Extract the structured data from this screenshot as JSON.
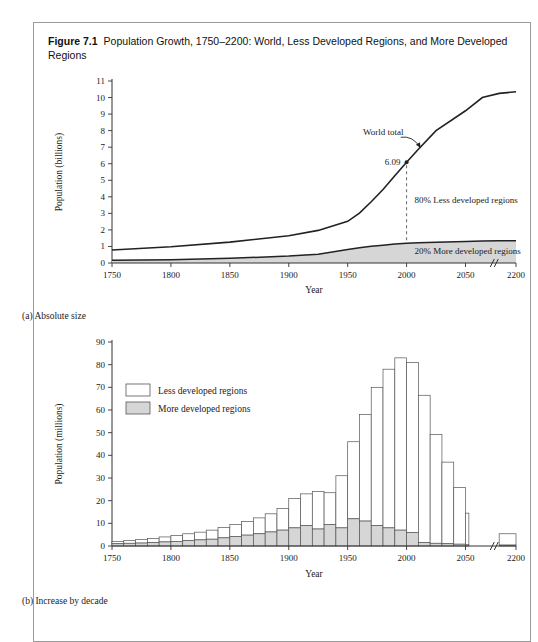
{
  "figure": {
    "number": "Figure 7.1",
    "title": "Population Growth, 1750–2200: World, Less Developed Regions, and More Developed Regions",
    "caption_a": "(a) Absolute size",
    "caption_b": "(b) Increase by decade"
  },
  "colors": {
    "line": "#222222",
    "more_developed_fill": "#d6d6d6",
    "less_developed_fill": "#ffffff",
    "bar_stroke": "#555555",
    "axis": "#333333",
    "border": "#9a9a9a"
  },
  "chart_data": [
    {
      "id": "panel-a",
      "type": "area",
      "title": "(a) Absolute size",
      "xlabel": "Year",
      "ylabel": "Population (billions)",
      "xlim": [
        1750,
        2200
      ],
      "ylim": [
        0,
        11
      ],
      "axis_break": {
        "label": "//",
        "after_tick": 2050
      },
      "xticks": [
        1750,
        1800,
        1850,
        1900,
        1950,
        2000,
        2050,
        2200
      ],
      "yticks": [
        0,
        1,
        2,
        3,
        4,
        5,
        6,
        7,
        8,
        9,
        10,
        11
      ],
      "grid": false,
      "annotations": [
        {
          "name": "world-total",
          "text": "World total",
          "x": 1995,
          "y": 7.6
        },
        {
          "name": "point-value",
          "text": "6.09",
          "x": 2000,
          "y": 6.09
        },
        {
          "name": "less-developed-share",
          "text": "80% Less developed regions",
          "x": 2010,
          "y": 3.6
        },
        {
          "name": "more-developed-share",
          "text": "20% More developed regions",
          "x": 2010,
          "y": 0.75
        }
      ],
      "x": [
        1750,
        1800,
        1850,
        1900,
        1925,
        1950,
        1960,
        1970,
        1980,
        1990,
        2000,
        2010,
        2025,
        2050,
        2100,
        2150,
        2200
      ],
      "series": [
        {
          "name": "World total",
          "values": [
            0.79,
            0.98,
            1.26,
            1.65,
            1.97,
            2.52,
            3.02,
            3.7,
            4.44,
            5.27,
            6.09,
            6.87,
            8.0,
            9.2,
            10.0,
            10.25,
            10.35
          ]
        },
        {
          "name": "More developed regions",
          "values": [
            0.16,
            0.2,
            0.28,
            0.42,
            0.53,
            0.81,
            0.92,
            1.01,
            1.08,
            1.15,
            1.19,
            1.22,
            1.26,
            1.3,
            1.33,
            1.34,
            1.35
          ]
        }
      ]
    },
    {
      "id": "panel-b",
      "type": "bar",
      "title": "(b) Increase by decade",
      "xlabel": "Year",
      "ylabel": "Population (millions)",
      "xlim": [
        1750,
        2200
      ],
      "ylim": [
        0,
        90
      ],
      "axis_break": {
        "label": "//",
        "after_tick": 2050
      },
      "xticks": [
        1750,
        1800,
        1850,
        1900,
        1950,
        2000,
        2050,
        2200
      ],
      "yticks": [
        0,
        10,
        20,
        30,
        40,
        50,
        60,
        70,
        80,
        90
      ],
      "grid": false,
      "stacked": true,
      "legend": {
        "position": "upper-left",
        "entries": [
          {
            "label": "Less developed regions",
            "fill": "#ffffff"
          },
          {
            "label": "More developed regions",
            "fill": "#d6d6d6"
          }
        ]
      },
      "categories": [
        1750,
        1760,
        1770,
        1780,
        1790,
        1800,
        1810,
        1820,
        1830,
        1840,
        1850,
        1860,
        1870,
        1880,
        1890,
        1900,
        1910,
        1920,
        1930,
        1940,
        1950,
        1960,
        1970,
        1980,
        1990,
        2000,
        2010,
        2020,
        2030,
        2040,
        2050,
        2150
      ],
      "series": [
        {
          "name": "More developed regions",
          "values": [
            1.0,
            1.2,
            1.3,
            1.5,
            1.8,
            2.0,
            2.4,
            2.7,
            3.0,
            3.6,
            4.2,
            4.8,
            5.4,
            6.2,
            7.0,
            8.0,
            9.0,
            7.5,
            9.5,
            8.0,
            12.0,
            11.0,
            9.0,
            8.0,
            7.0,
            6.0,
            1.5,
            1.2,
            1.0,
            0.8,
            0.5,
            0.4
          ]
        },
        {
          "name": "Less developed regions",
          "values": [
            1.0,
            1.2,
            1.5,
            1.8,
            2.2,
            2.6,
            3.0,
            3.4,
            4.0,
            4.6,
            5.3,
            6.0,
            7.0,
            8.0,
            9.5,
            13.0,
            14.0,
            16.5,
            14.0,
            23.0,
            34.0,
            47.0,
            61.0,
            70.0,
            76.0,
            75.0,
            65.0,
            48.0,
            36.0,
            25.0,
            14.0,
            5.0
          ]
        }
      ],
      "totals": [
        2.0,
        2.4,
        2.8,
        3.3,
        4.0,
        4.6,
        5.4,
        6.1,
        7.0,
        8.2,
        9.5,
        10.8,
        12.4,
        14.2,
        16.5,
        21.0,
        23.0,
        24.0,
        23.5,
        31.0,
        46.0,
        58.0,
        70.0,
        78.0,
        83.0,
        81.0,
        66.5,
        49.2,
        37.0,
        25.8,
        14.5,
        5.4
      ]
    }
  ]
}
